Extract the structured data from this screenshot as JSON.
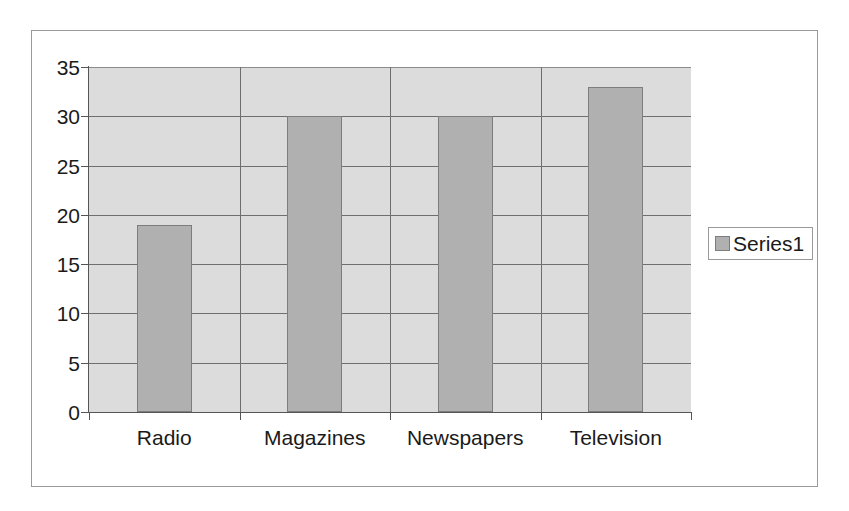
{
  "chart_data": {
    "type": "bar",
    "title": "",
    "subtitle": "",
    "xlabel": "",
    "ylabel": "",
    "categories": [
      "Radio",
      "Magazines",
      "Newspapers",
      "Television"
    ],
    "values": [
      19,
      30,
      30,
      33
    ],
    "series": [
      {
        "name": "Series1",
        "values": [
          19,
          30,
          30,
          33
        ]
      }
    ],
    "ylim": [
      0,
      35
    ],
    "y_ticks": [
      0,
      5,
      10,
      15,
      20,
      25,
      30,
      35
    ],
    "y_tick_labels": [
      "0",
      "5",
      "10",
      "15",
      "20",
      "25",
      "30",
      "35"
    ],
    "grid": "horizontal-and-vertical",
    "legend": {
      "position": "right",
      "entries": [
        {
          "label": "Series1",
          "color": "#b0b0b0"
        }
      ]
    },
    "colors": {
      "bar_fill": "#b0b0b0",
      "bar_border": "#7d7d7d",
      "plot_background": "#dcdcdc",
      "page_background": "#ffffff",
      "gridline": "#6e6e6e",
      "axis": "#555555",
      "text": "#1a1a1a",
      "frame_border": "#9a9a9a"
    }
  }
}
